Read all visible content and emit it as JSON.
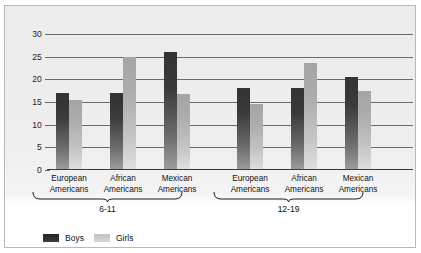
{
  "chart_data": {
    "type": "bar",
    "title": "",
    "xlabel": "",
    "ylabel": "",
    "ylim": [
      0,
      30
    ],
    "yticks": [
      0,
      5,
      10,
      15,
      20,
      25,
      30
    ],
    "ytick_labels": [
      "0",
      "5",
      "10",
      "15",
      "20",
      "25",
      "30"
    ],
    "grid": true,
    "legend_position": "bottom-left",
    "categories": [
      "European Americans",
      "African Americans",
      "Mexican Americans",
      "European Americans",
      "African Americans",
      "Mexican Americans"
    ],
    "groups": [
      {
        "label": "6-11",
        "categories": [
          "European Americans",
          "African Americans",
          "Mexican Americans"
        ]
      },
      {
        "label": "12-19",
        "categories": [
          "European Americans",
          "African Americans",
          "Mexican Americans"
        ]
      }
    ],
    "series": [
      {
        "name": "Boys",
        "color": "#3a3a3a",
        "values": [
          17.0,
          17.0,
          26.0,
          18.0,
          18.0,
          20.5
        ]
      },
      {
        "name": "Girls",
        "color": "#b5b5b5",
        "values": [
          15.5,
          25.0,
          16.8,
          14.5,
          23.5,
          17.5
        ]
      }
    ]
  },
  "legend": {
    "items": [
      {
        "label": "Boys",
        "swatch": "boys"
      },
      {
        "label": "Girls",
        "swatch": "girls"
      }
    ]
  },
  "category_labels": [
    {
      "line1": "European",
      "line2": "Americans"
    },
    {
      "line1": "African",
      "line2": "Americans"
    },
    {
      "line1": "Mexican",
      "line2": "Americans"
    },
    {
      "line1": "European",
      "line2": "Americans"
    },
    {
      "line1": "African",
      "line2": "Americans"
    },
    {
      "line1": "Mexican",
      "line2": "Americans"
    }
  ],
  "group_labels": [
    "6-11",
    "12-19"
  ]
}
